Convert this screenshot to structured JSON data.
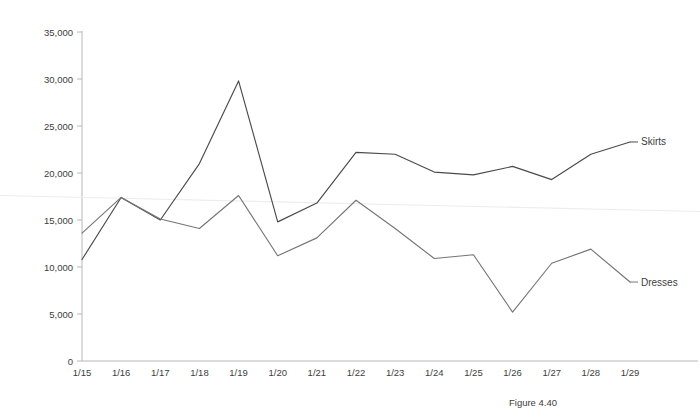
{
  "caption": "Figure 4.40",
  "chart_data": {
    "type": "line",
    "title": "",
    "xlabel": "",
    "ylabel": "",
    "categories": [
      "1/15",
      "1/16",
      "1/17",
      "1/18",
      "1/19",
      "1/20",
      "1/21",
      "1/22",
      "1/23",
      "1/24",
      "1/25",
      "1/26",
      "1/27",
      "1/28",
      "1/29"
    ],
    "ylim": [
      0,
      35000
    ],
    "ytick_labels": [
      "35,000",
      "30,000",
      "25,000",
      "20,000",
      "15,000",
      "10,000",
      "5,000",
      "0"
    ],
    "ytick_values": [
      35000,
      30000,
      25000,
      20000,
      15000,
      10000,
      5000,
      0
    ],
    "grid": false,
    "legend": "inline-right-end-labels",
    "series": [
      {
        "name": "Skirts",
        "color": "#4a4a4a",
        "values": [
          10800,
          17400,
          15000,
          21000,
          29800,
          14800,
          16800,
          22200,
          22000,
          20100,
          19800,
          20700,
          19300,
          22000,
          23300
        ]
      },
      {
        "name": "Dresses",
        "color": "#767676",
        "values": [
          13600,
          17400,
          15100,
          14100,
          17600,
          11200,
          13100,
          17100,
          14100,
          10900,
          11300,
          5200,
          10400,
          11900,
          8400
        ]
      }
    ],
    "annotations": [
      {
        "name": "trendline",
        "color": "#ededed",
        "start_value": 17600,
        "end_value": 15900
      }
    ]
  }
}
